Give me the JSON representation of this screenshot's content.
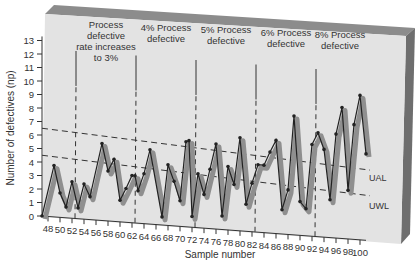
{
  "chart_data": {
    "type": "line",
    "title": "",
    "xlabel": "Sample number",
    "ylabel": "Number of defectives (np)",
    "xlim": [
      47,
      101
    ],
    "ylim": [
      0,
      13
    ],
    "x_ticks": [
      48,
      50,
      52,
      54,
      56,
      58,
      60,
      62,
      64,
      66,
      68,
      70,
      72,
      74,
      76,
      78,
      80,
      82,
      84,
      86,
      88,
      90,
      92,
      94,
      96,
      98,
      100
    ],
    "y_ticks": [
      0,
      1,
      2,
      3,
      4,
      5,
      6,
      7,
      8,
      9,
      10,
      11,
      12,
      13
    ],
    "grid": false,
    "legend": null,
    "phases": [
      {
        "label": "Process defective rate increases to 3%",
        "x_start": 52,
        "x_end": 62
      },
      {
        "label": "4% Process defective",
        "x_start": 62,
        "x_end": 72
      },
      {
        "label": "5% Process defective",
        "x_start": 72,
        "x_end": 82
      },
      {
        "label": "6% Process defective",
        "x_start": 82,
        "x_end": 92
      },
      {
        "label": "8% Process defective",
        "x_start": 92,
        "x_end": 101
      }
    ],
    "limits": [
      {
        "name": "UAL",
        "y_left": 6.5,
        "y_right": 5.2,
        "style": "dashed"
      },
      {
        "name": "UWL",
        "y_left": 4.5,
        "y_right": 3.3,
        "style": "dashed"
      }
    ],
    "series": [
      {
        "name": "np",
        "x": [
          47,
          49,
          50,
          51,
          52,
          53,
          54,
          55,
          57,
          58,
          59,
          60,
          61,
          62,
          62.5,
          63,
          64,
          65,
          67,
          68,
          69,
          70,
          71,
          71.5,
          72,
          73,
          74,
          75,
          76,
          77,
          78,
          79,
          80,
          81,
          82,
          83,
          84,
          85,
          86,
          87,
          88,
          89,
          90,
          91,
          92,
          93,
          94,
          95,
          96,
          97,
          98,
          99,
          100,
          101
        ],
        "values": [
          0,
          3.8,
          1.8,
          0.8,
          2.7,
          0.8,
          2.6,
          1.7,
          5.7,
          3.7,
          4.6,
          1.6,
          2.5,
          3.5,
          3.5,
          2.4,
          3.7,
          5.5,
          0.6,
          4.5,
          3.3,
          1.9,
          6.3,
          6.4,
          0.8,
          4.0,
          2.5,
          4.4,
          6.3,
          1.0,
          4.7,
          3.4,
          6.9,
          2.0,
          3.6,
          5.0,
          5.0,
          6.0,
          6.9,
          1.8,
          3.3,
          8.8,
          2.5,
          2.0,
          6.8,
          7.7,
          6.5,
          2.8,
          7.7,
          9.7,
          3.6,
          8.5,
          10.7,
          6.4
        ]
      }
    ]
  }
}
